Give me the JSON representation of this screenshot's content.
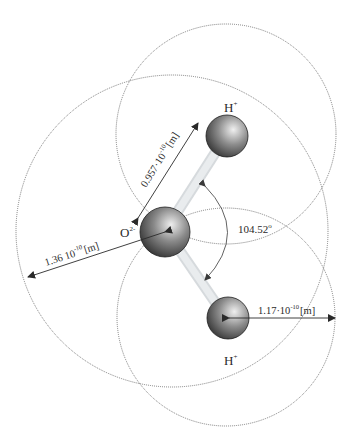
{
  "diagram": {
    "atoms": {
      "oxygen": {
        "label": "O",
        "charge": "2-"
      },
      "hydrogen_top": {
        "label": "H",
        "charge": "+"
      },
      "hydrogen_bottom": {
        "label": "H",
        "charge": "+"
      }
    },
    "annotations": {
      "bond_length": {
        "value": "0.957",
        "mult": "·10",
        "exp": "-10",
        "unit": "[m]"
      },
      "oxygen_radius": {
        "value": "1.36",
        "mult": " 10",
        "exp": "-10",
        "unit": "[m]"
      },
      "hydrogen_radius": {
        "value": "1.17",
        "mult": "·10",
        "exp": "-10",
        "unit": "[m]"
      },
      "bond_angle": {
        "value": "104.52",
        "unit": "o"
      }
    },
    "colors": {
      "dotted_circle": "#6e6e6e",
      "bond": "#d9dde0",
      "arrow": "#2a2a2a",
      "sphere_dark": "#2b2b2b",
      "sphere_light": "#e6e6e6"
    }
  }
}
